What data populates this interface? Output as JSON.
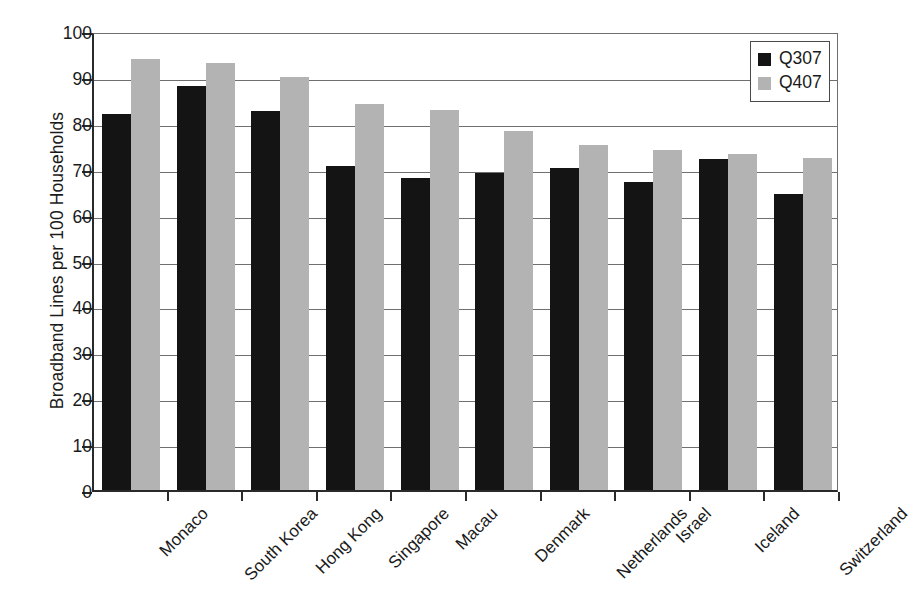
{
  "chart_data": {
    "type": "bar",
    "title": "",
    "xlabel": "",
    "ylabel": "Broadband Lines per 100 Households",
    "ylim": [
      0,
      100
    ],
    "ytick_step": 10,
    "yticks": [
      0,
      10,
      20,
      30,
      40,
      50,
      60,
      70,
      80,
      90,
      100
    ],
    "grid": true,
    "legend_position": "top-right",
    "categories": [
      "Monaco",
      "South Korea",
      "Hong Kong",
      "Singapore",
      "Macau",
      "Denmark",
      "Netherlands",
      "Israel",
      "Iceland",
      "Switzerland"
    ],
    "series": [
      {
        "name": "Q307",
        "color": "#141414",
        "values": [
          82.0,
          88.0,
          82.5,
          70.7,
          68.0,
          69.0,
          70.2,
          67.0,
          72.2,
          64.5
        ]
      },
      {
        "name": "Q407",
        "color": "#b3b3b3",
        "values": [
          93.8,
          93.0,
          90.0,
          84.0,
          82.8,
          78.2,
          75.2,
          74.0,
          73.2,
          72.3
        ]
      }
    ]
  },
  "legend": {
    "items": [
      {
        "label": "Q307",
        "color": "#141414"
      },
      {
        "label": "Q407",
        "color": "#b3b3b3"
      }
    ]
  },
  "axes": {
    "y_title": "Broadband Lines per 100 Households"
  }
}
